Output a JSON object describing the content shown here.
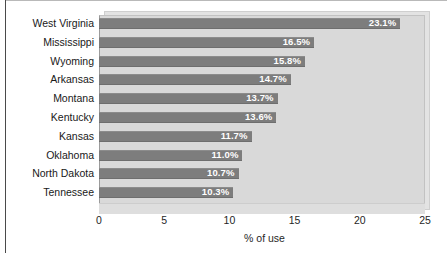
{
  "chart_data": {
    "type": "bar",
    "orientation": "horizontal",
    "title": "",
    "xlabel": "% of use",
    "ylabel": "",
    "xlim": [
      0,
      25
    ],
    "xticks": [
      0,
      5,
      10,
      15,
      20,
      25
    ],
    "xtick_labels": [
      "0",
      "5",
      "10",
      "15",
      "20",
      "25"
    ],
    "grid": false,
    "legend": null,
    "categories": [
      "West Virginia",
      "Mississippi",
      "Wyoming",
      "Arkansas",
      "Montana",
      "Kentucky",
      "Kansas",
      "Oklahoma",
      "North Dakota",
      "Tennessee"
    ],
    "values": [
      23.1,
      16.5,
      15.8,
      14.7,
      13.7,
      13.6,
      11.7,
      11.0,
      10.7,
      10.3
    ],
    "value_labels": [
      "23.1%",
      "16.5%",
      "15.8%",
      "14.7%",
      "13.7%",
      "13.6%",
      "11.7%",
      "11.0%",
      "10.7%",
      "10.3%"
    ],
    "colors": {
      "bar": "#7d7d7d",
      "plot_background": "#d9d9d9",
      "plot_depth": "#e3e3e3",
      "figure_background": "#ffffff",
      "value_label": "#ffffff",
      "text": "#191919"
    }
  }
}
